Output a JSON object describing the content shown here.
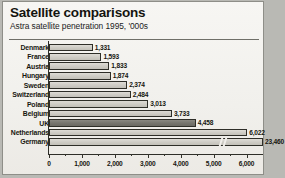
{
  "header": {
    "title": "Satellite comparisons",
    "subtitle": "Astra satellite penetration 1995, '000s"
  },
  "chart_data": {
    "type": "bar",
    "orientation": "horizontal",
    "title": "Satellite comparisons",
    "subtitle": "Astra satellite penetration 1995, '000s",
    "xlabel": "",
    "ylabel": "",
    "units": "'000s",
    "xlim": [
      0,
      6500
    ],
    "axis_ticks": [
      "0",
      "1,000",
      "2,000",
      "3,000",
      "4,000",
      "5,000",
      "6,000"
    ],
    "axis_tick_values": [
      0,
      1000,
      2000,
      3000,
      4000,
      5000,
      6000
    ],
    "minor_ticks": true,
    "grid": false,
    "legend": "none",
    "axis_break_note": "Germany bar is truncated with an axis-break marker; value exceeds chart scale",
    "categories": [
      "Denmark",
      "France",
      "Austria",
      "Hungary",
      "Sweden",
      "Switzerland",
      "Poland",
      "Belgium",
      "UK",
      "Netherlands",
      "Germany"
    ],
    "values": [
      1331,
      1593,
      1833,
      1874,
      2374,
      2484,
      3013,
      3733,
      4458,
      6022,
      23460
    ],
    "value_labels": [
      "1,331",
      "1,593",
      "1,833",
      "1,874",
      "2,374",
      "2,484",
      "3,013",
      "3,733",
      "4,458",
      "6,022",
      "23,460"
    ],
    "highlighted_category": "UK",
    "colors": {
      "bar": "#cfcdc6",
      "bar_highlight": "#76756e",
      "bar_border": "#2e2e28",
      "axis": "#2e2e28",
      "text": "#16160f",
      "background": "#f3f2ee",
      "frame": "#8e8e88"
    }
  }
}
